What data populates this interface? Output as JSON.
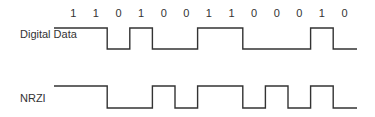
{
  "diagram": {
    "bits": [
      "1",
      "1",
      "0",
      "1",
      "0",
      "0",
      "1",
      "1",
      "0",
      "0",
      "0",
      "1",
      "0"
    ],
    "rows": [
      {
        "label": "Digital Data",
        "levels": [
          1,
          1,
          0,
          1,
          0,
          0,
          1,
          1,
          0,
          0,
          0,
          1,
          0
        ]
      },
      {
        "label": "NRZI",
        "levels": [
          1,
          1,
          0,
          0,
          1,
          0,
          1,
          1,
          0,
          1,
          0,
          1,
          0
        ]
      }
    ],
    "colors": {
      "line": "#333333",
      "text": "#333333",
      "background": "#ffffff"
    }
  },
  "geometry": {
    "lead_in_x": 54,
    "first_cell_x": 62,
    "cell_width": 22.6,
    "end_x": 357,
    "bit_label_y": 17,
    "rows": [
      {
        "label_x": 20,
        "label_y": 38,
        "high_y": 28,
        "low_y": 49
      },
      {
        "label_x": 20,
        "label_y": 102,
        "high_y": 86,
        "low_y": 108
      }
    ]
  }
}
